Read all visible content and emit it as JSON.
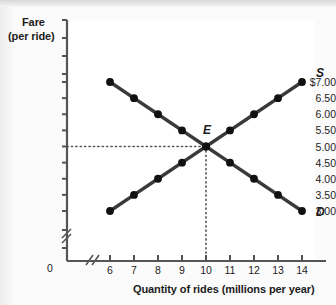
{
  "chart_data": {
    "type": "line",
    "title": "",
    "xlabel": "Quantity of rides (millions per year)",
    "ylabel_line1": "Fare",
    "ylabel_line2": "(per ride)",
    "xlim": [
      6,
      14
    ],
    "ylim": [
      3.0,
      7.0
    ],
    "x_axis_break": true,
    "y_axis_break": true,
    "x_origin_label": "0",
    "grid": false,
    "legend": "inline-curve-labels",
    "x": [
      6,
      7,
      8,
      9,
      10,
      11,
      12,
      13,
      14
    ],
    "xtick_labels": [
      "6",
      "7",
      "8",
      "9",
      "10",
      "11",
      "12",
      "13",
      "14"
    ],
    "ytick_values": [
      7.0,
      6.5,
      6.0,
      5.5,
      5.0,
      4.5,
      4.0,
      3.5,
      3.0
    ],
    "ytick_labels": [
      "$7.00",
      "6.50",
      "6.00",
      "5.50",
      "5.00",
      "4.50",
      "4.00",
      "3.50",
      "3.00"
    ],
    "series": [
      {
        "name": "Demand",
        "label": "D",
        "values": [
          7.0,
          6.5,
          6.0,
          5.5,
          5.0,
          4.5,
          4.0,
          3.5,
          3.0
        ],
        "color": "#3a3a3a",
        "marker": "filled-circle"
      },
      {
        "name": "Supply",
        "label": "S",
        "values": [
          3.0,
          3.5,
          4.0,
          4.5,
          5.0,
          5.5,
          6.0,
          6.5,
          7.0
        ],
        "color": "#3a3a3a",
        "marker": "filled-circle"
      }
    ],
    "annotations": [
      {
        "label": "E",
        "description": "equilibrium point",
        "x": 10,
        "y": 5.0,
        "guide_lines": [
          "horizontal-dotted-to-y-axis",
          "vertical-dotted-to-x-axis"
        ]
      }
    ],
    "colors": {
      "curve": "#3a3a3a",
      "marker": "#111111",
      "axis": "#555555",
      "text": "#1b1b1b",
      "guide_dotted": "#555555",
      "plot_background": "#ffffff"
    }
  }
}
